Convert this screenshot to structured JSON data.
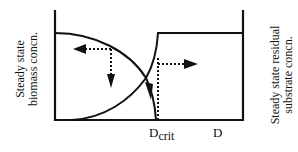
{
  "diagram": {
    "left_axis_label_line1": "Steady state",
    "left_axis_label_line2": "biomass concn.",
    "right_axis_label_line1": "Steady state residual",
    "right_axis_label_line2": "substrate concn.",
    "x_tick_dcrit_main": "D",
    "x_tick_dcrit_sub": "crit",
    "x_tick_d": "D",
    "colors": {
      "line": "#111111",
      "background": "#ffffff"
    }
  }
}
